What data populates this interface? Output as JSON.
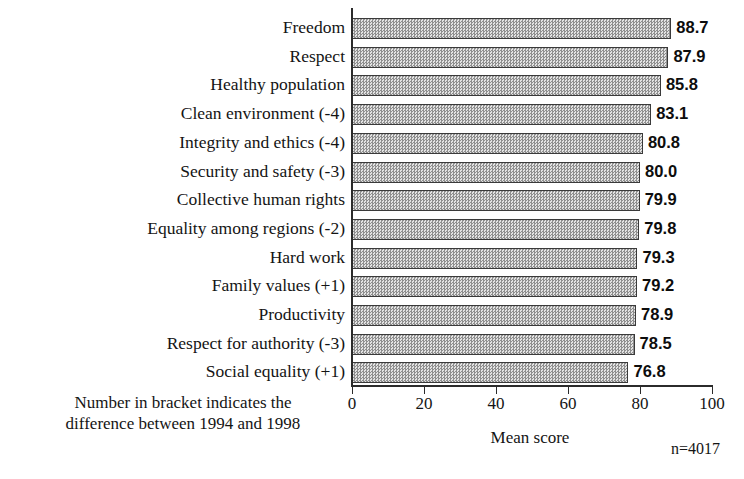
{
  "chart_data": {
    "type": "bar",
    "orientation": "horizontal",
    "title": "",
    "xlabel": "Mean score",
    "ylabel": "",
    "xlim": [
      0,
      100
    ],
    "xticks": [
      0,
      20,
      40,
      60,
      80,
      100
    ],
    "grid": false,
    "legend": null,
    "categories": [
      "Freedom",
      "Respect",
      "Healthy population",
      "Clean environment (-4)",
      "Integrity and ethics (-4)",
      "Security and safety (-3)",
      "Collective human rights",
      "Equality among regions (-2)",
      "Hard work",
      "Family values (+1)",
      "Productivity",
      "Respect for authority (-3)",
      "Social equality (+1)"
    ],
    "values": [
      88.7,
      87.9,
      85.8,
      83.1,
      80.8,
      80.0,
      79.9,
      79.8,
      79.3,
      79.2,
      78.9,
      78.5,
      76.8
    ],
    "value_labels": [
      "88.7",
      "87.9",
      "85.8",
      "83.1",
      "80.8",
      "80.0",
      "79.9",
      "79.8",
      "79.3",
      "79.2",
      "78.9",
      "78.5",
      "76.8"
    ],
    "annotations": [
      "Number in bracket indicates the difference between 1994 and 1998",
      "n=4017"
    ]
  },
  "footnote": {
    "line1": "Number in bracket indicates the",
    "line2": "difference between 1994 and 1998"
  },
  "axis": {
    "x_title": "Mean score",
    "tick_labels": [
      "0",
      "20",
      "40",
      "60",
      "80",
      "100"
    ]
  },
  "sample": {
    "label": "n=4017"
  },
  "colors": {
    "bar_fill": "#c9c9c9",
    "bar_pattern_dark": "#8f8f8f",
    "bar_border": "#3a3a3a",
    "axis": "#2b2b2b",
    "text": "#141414",
    "background": "#ffffff"
  }
}
